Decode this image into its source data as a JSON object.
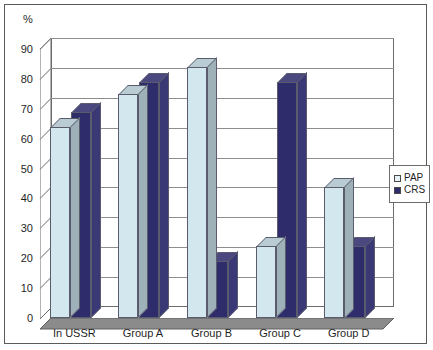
{
  "chart_data": {
    "type": "bar",
    "title": "",
    "subtitle": "",
    "unit_label": "%",
    "xlabel": "",
    "ylabel": "%",
    "ylim": [
      0,
      90
    ],
    "yticks": [
      0,
      10,
      20,
      30,
      40,
      50,
      60,
      70,
      80,
      90
    ],
    "grid": true,
    "legend_position": "right",
    "style": "3d-clustered-column",
    "categories": [
      "In USSR",
      "Group A",
      "Group B",
      "Group C",
      "Group D"
    ],
    "series": [
      {
        "name": "PAP",
        "color": "#d3e7ee",
        "values": [
          64,
          75,
          84,
          24,
          44
        ]
      },
      {
        "name": "CRS",
        "color": "#2e2c6b",
        "values": [
          69,
          79,
          19,
          79,
          24
        ]
      }
    ]
  },
  "legend": {
    "items": [
      {
        "label": "PAP",
        "swatch": "pap-swatch"
      },
      {
        "label": "CRS",
        "swatch": "crs-swatch"
      }
    ]
  },
  "colors": {
    "pap": "#d3e7ee",
    "crs": "#2e2c6b",
    "frame": "#5a5a5a",
    "grid": "#8d8d8d",
    "text": "#1f1f1f"
  }
}
